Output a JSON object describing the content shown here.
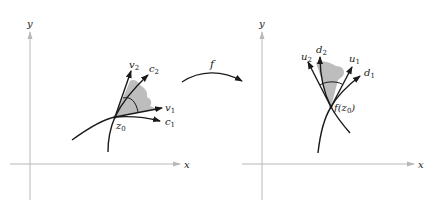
{
  "figure": {
    "mapping_label": "f",
    "left_panel": {
      "axis_x_label": "x",
      "axis_y_label": "y",
      "point_label": "z",
      "point_sub": "0",
      "vectors": [
        {
          "name": "v",
          "sub": "1"
        },
        {
          "name": "v",
          "sub": "2"
        }
      ],
      "curves": [
        {
          "name": "c",
          "sub": "1"
        },
        {
          "name": "c",
          "sub": "2"
        }
      ]
    },
    "right_panel": {
      "axis_x_label": "x",
      "axis_y_label": "y",
      "point_label_prefix": "f(z",
      "point_sub": "0",
      "point_label_suffix": ")",
      "vectors": [
        {
          "name": "u",
          "sub": "1"
        },
        {
          "name": "u",
          "sub": "2"
        }
      ],
      "curves": [
        {
          "name": "d",
          "sub": "1"
        },
        {
          "name": "d",
          "sub": "2"
        }
      ]
    },
    "colors": {
      "axis": "#b8b8b8",
      "curve": "#1a1a1a",
      "shade": "#bdbdbd"
    }
  }
}
